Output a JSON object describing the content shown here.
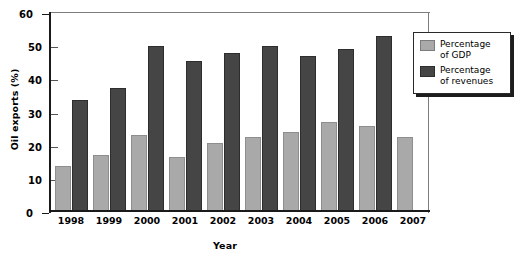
{
  "chart_data": {
    "type": "bar",
    "title": "",
    "xlabel": "Year",
    "ylabel": "Oil exports (%)",
    "categories": [
      "1998",
      "1999",
      "2000",
      "2001",
      "2002",
      "2003",
      "2004",
      "2005",
      "2006",
      "2007"
    ],
    "series": [
      {
        "name": "Percentage of GDP",
        "color": "#a9a9a9",
        "values": [
          13.3,
          16.7,
          22.5,
          16.1,
          20.2,
          22.0,
          23.4,
          26.4,
          25.3,
          22.0
        ]
      },
      {
        "name": "Percentage of revenues",
        "color": "#454545",
        "values": [
          33.3,
          36.7,
          49.6,
          45.0,
          47.4,
          49.4,
          46.4,
          48.5,
          52.5,
          null
        ]
      }
    ],
    "ylim": [
      0,
      60
    ],
    "yticks": [
      0,
      10,
      20,
      30,
      40,
      50,
      60
    ],
    "ytick_labels": [
      "0",
      "10",
      "20",
      "30",
      "40",
      "50",
      "60"
    ],
    "grid": false,
    "legend_position": "right-top",
    "legend": [
      {
        "label_line1": "Percentage",
        "label_line2": "of GDP",
        "swatch": "gdp"
      },
      {
        "label_line1": "Percentage",
        "label_line2": "of revenues",
        "swatch": "rev"
      }
    ]
  }
}
